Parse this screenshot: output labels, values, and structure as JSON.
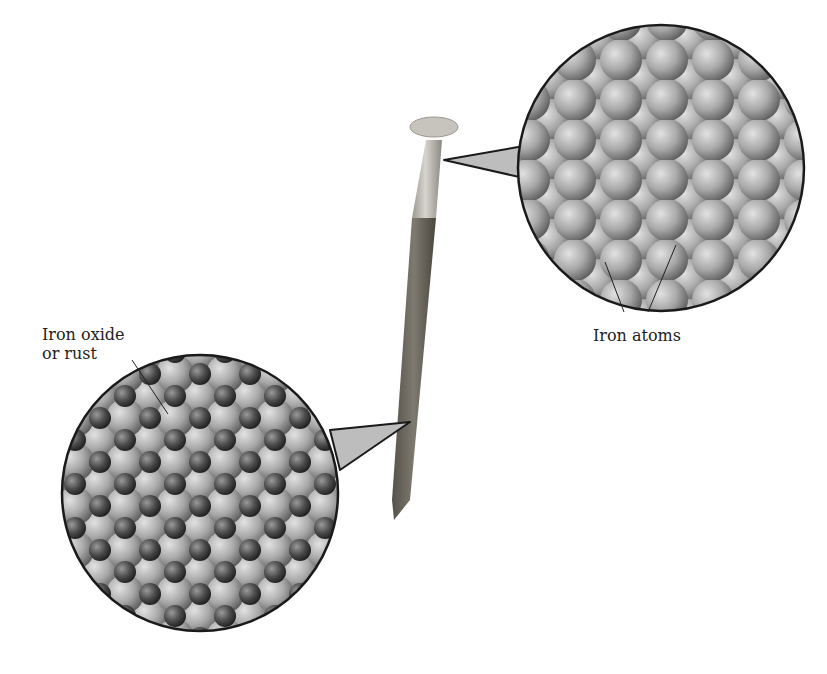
{
  "labels": {
    "rust_line1": "Iron oxide",
    "rust_line2": "or rust",
    "iron_atoms": "Iron atoms"
  },
  "colors": {
    "background": "#ffffff",
    "outline": "#1a1a1a",
    "iron_atom": "#9a9a9a",
    "oxygen_atom": "#4a4a4a",
    "nail_clean": "#c8c8c0",
    "nail_rust": "#6e6a60"
  }
}
